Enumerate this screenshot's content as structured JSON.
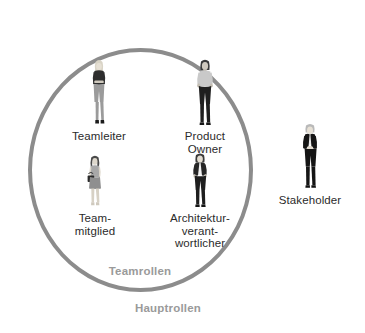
{
  "diagram": {
    "zones": {
      "inner": {
        "id": "teamrollen",
        "caption": "Teamrollen",
        "caption_color": "#9a9a9a",
        "shape": "circle",
        "border_color": "#8c8c8c"
      },
      "outer": {
        "id": "hauptrollen",
        "caption": "Hauptrollen",
        "caption_color": "#9a9a9a"
      }
    },
    "roles": [
      {
        "id": "teamleiter",
        "label": "Teamleiter",
        "zone": "teamrollen",
        "figure": "standing-woman-blonde-dark-top",
        "colors": {
          "hair": "#d8d3c8",
          "top": "#2e2e2e",
          "bottom": "#9b9b9b"
        }
      },
      {
        "id": "product-owner",
        "label": "Product\nOwner",
        "zone": "teamrollen",
        "figure": "standing-man-grey-tshirt",
        "colors": {
          "hair": "#3a3a3a",
          "top": "#c9c9c9",
          "bottom": "#1f1f1f"
        }
      },
      {
        "id": "teammitglied",
        "label": "Team-\nmitglied",
        "zone": "teamrollen",
        "figure": "standing-woman-grey-dress-handbag",
        "colors": {
          "hair": "#4a4a4a",
          "top": "#a8a8a8",
          "bottom": "#8f8f8f",
          "bag": "#2a2a2a"
        }
      },
      {
        "id": "architekturverantwortlicher",
        "label": "Architektur-\nverant-\nwortlicher",
        "zone": "teamrollen",
        "figure": "standing-man-dark-jacket-white-shirt",
        "colors": {
          "hair": "#3a3a3a",
          "top": "#262626",
          "shirt": "#f2f2f2",
          "bottom": "#1e1e1e"
        }
      },
      {
        "id": "stakeholder",
        "label": "Stakeholder",
        "zone": "hauptrollen",
        "figure": "standing-man-dark-suit",
        "colors": {
          "hair": "#b9b9b9",
          "top": "#151515",
          "shirt": "#e8e8e8",
          "bottom": "#151515"
        }
      }
    ]
  }
}
